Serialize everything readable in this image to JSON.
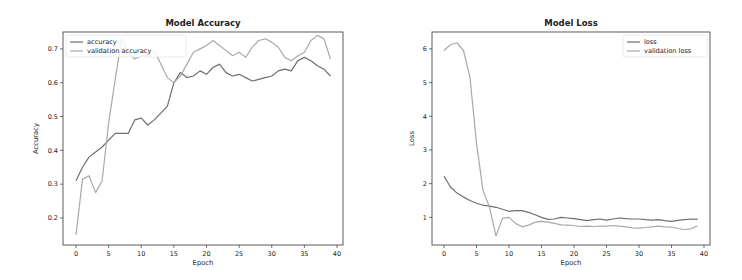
{
  "chart_data": [
    {
      "type": "line",
      "title": "Model Accuracy",
      "xlabel": "Epoch",
      "ylabel": "Accuracy",
      "xlim": [
        -2,
        41
      ],
      "ylim": [
        0.12,
        0.75
      ],
      "xticks": [
        0,
        5,
        10,
        15,
        20,
        25,
        30,
        35,
        40
      ],
      "yticks": [
        0.2,
        0.3,
        0.4,
        0.5,
        0.6,
        0.7
      ],
      "ytick_labels": [
        "0.2",
        "0.3",
        "0.4",
        "0.5",
        "0.6",
        "0.7"
      ],
      "grid": false,
      "legend_position": "upper left",
      "x": [
        0,
        1,
        2,
        3,
        4,
        5,
        6,
        7,
        8,
        9,
        10,
        11,
        12,
        13,
        14,
        15,
        16,
        17,
        18,
        19,
        20,
        21,
        22,
        23,
        24,
        25,
        26,
        27,
        28,
        29,
        30,
        31,
        32,
        33,
        34,
        35,
        36,
        37,
        38,
        39
      ],
      "series": [
        {
          "name": "accuracy",
          "color": "#6e6e6e",
          "values": [
            0.31,
            0.35,
            0.38,
            0.395,
            0.41,
            0.43,
            0.45,
            0.45,
            0.45,
            0.49,
            0.495,
            0.475,
            0.49,
            0.51,
            0.53,
            0.6,
            0.63,
            0.615,
            0.62,
            0.635,
            0.625,
            0.645,
            0.655,
            0.63,
            0.62,
            0.625,
            0.615,
            0.605,
            0.61,
            0.615,
            0.62,
            0.635,
            0.64,
            0.635,
            0.665,
            0.675,
            0.665,
            0.65,
            0.64,
            0.62
          ]
        },
        {
          "name": "validation accuracy",
          "color": "#a9a9a9",
          "values": [
            0.15,
            0.315,
            0.325,
            0.275,
            0.31,
            0.48,
            0.61,
            0.73,
            0.69,
            0.67,
            0.68,
            0.68,
            0.695,
            0.655,
            0.615,
            0.6,
            0.62,
            0.655,
            0.69,
            0.7,
            0.71,
            0.725,
            0.71,
            0.695,
            0.68,
            0.69,
            0.675,
            0.705,
            0.725,
            0.73,
            0.72,
            0.705,
            0.675,
            0.665,
            0.68,
            0.69,
            0.725,
            0.74,
            0.73,
            0.67
          ]
        }
      ]
    },
    {
      "type": "line",
      "title": "Model Loss",
      "xlabel": "Epoch",
      "ylabel": "Loss",
      "xlim": [
        -2,
        41
      ],
      "ylim": [
        0.18,
        6.5
      ],
      "xticks": [
        0,
        5,
        10,
        15,
        20,
        25,
        30,
        35,
        40
      ],
      "yticks": [
        1,
        2,
        3,
        4,
        5,
        6
      ],
      "ytick_labels": [
        "1",
        "2",
        "3",
        "4",
        "5",
        "6"
      ],
      "grid": false,
      "legend_position": "upper right",
      "x": [
        0,
        1,
        2,
        3,
        4,
        5,
        6,
        7,
        8,
        9,
        10,
        11,
        12,
        13,
        14,
        15,
        16,
        17,
        18,
        19,
        20,
        21,
        22,
        23,
        24,
        25,
        26,
        27,
        28,
        29,
        30,
        31,
        32,
        33,
        34,
        35,
        36,
        37,
        38,
        39
      ],
      "series": [
        {
          "name": "loss",
          "color": "#6e6e6e",
          "values": [
            2.22,
            1.9,
            1.72,
            1.6,
            1.5,
            1.42,
            1.36,
            1.33,
            1.3,
            1.24,
            1.18,
            1.2,
            1.2,
            1.15,
            1.08,
            1.0,
            0.94,
            0.95,
            1.0,
            0.98,
            0.96,
            0.93,
            0.9,
            0.93,
            0.95,
            0.92,
            0.95,
            0.98,
            0.96,
            0.95,
            0.95,
            0.93,
            0.92,
            0.93,
            0.9,
            0.88,
            0.91,
            0.93,
            0.95,
            0.94
          ]
        },
        {
          "name": "validation loss",
          "color": "#a9a9a9",
          "values": [
            5.95,
            6.12,
            6.18,
            5.95,
            5.15,
            3.2,
            1.8,
            1.3,
            0.45,
            0.97,
            1.0,
            0.82,
            0.72,
            0.77,
            0.85,
            0.88,
            0.86,
            0.82,
            0.78,
            0.77,
            0.76,
            0.73,
            0.74,
            0.73,
            0.74,
            0.74,
            0.76,
            0.74,
            0.72,
            0.69,
            0.68,
            0.7,
            0.72,
            0.74,
            0.72,
            0.71,
            0.67,
            0.64,
            0.66,
            0.75
          ]
        }
      ]
    }
  ]
}
